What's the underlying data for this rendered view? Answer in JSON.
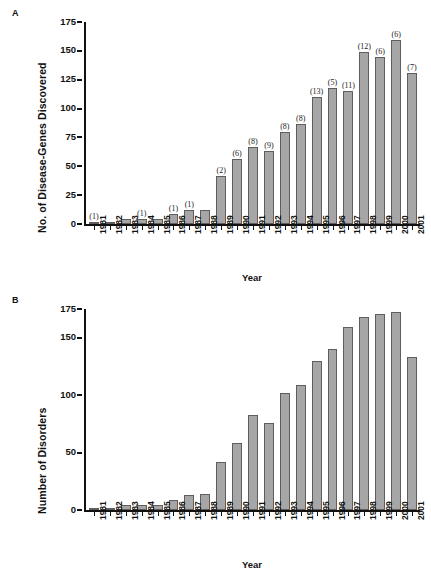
{
  "figure": {
    "panel_a_label": "A",
    "panel_b_label": "B"
  },
  "chart_data": [
    {
      "type": "bar",
      "panel": "A",
      "title": "",
      "xlabel": "Year",
      "ylabel": "No. of Disease-Genes Discovered",
      "ylim": [
        0,
        175
      ],
      "yticks": [
        0,
        25,
        50,
        75,
        100,
        125,
        150,
        175
      ],
      "grid": false,
      "legend": "none",
      "bar_color": "#a6a6a6",
      "bar_edge_color": "#5e5e5e",
      "categories": [
        "1981",
        "1982",
        "1983",
        "1984",
        "1985",
        "1986",
        "1987",
        "1988",
        "1989",
        "1990",
        "1991",
        "1992",
        "1993",
        "1994",
        "1995",
        "1996",
        "1997",
        "1998",
        "1999",
        "2000",
        "2001"
      ],
      "values": [
        2,
        1,
        4,
        4,
        4,
        9,
        12,
        12,
        42,
        56,
        67,
        63,
        80,
        87,
        110,
        118,
        115,
        149,
        145,
        159,
        131
      ],
      "annotations": [
        "(1)",
        "",
        "",
        "(1)",
        "",
        "(1)",
        "(1)",
        "",
        "(2)",
        "(6)",
        "(8)",
        "(9)",
        "(8)",
        "(8)",
        "(13)",
        "(5)",
        "(11)",
        "(12)",
        "(6)",
        "(6)",
        "(7)"
      ]
    },
    {
      "type": "bar",
      "panel": "B",
      "title": "",
      "xlabel": "Year",
      "ylabel": "Number of Disorders",
      "ylim": [
        0,
        175
      ],
      "yticks": [
        0,
        50,
        100,
        150,
        175
      ],
      "grid": false,
      "legend": "none",
      "bar_color": "#a6a6a6",
      "bar_edge_color": "#5e5e5e",
      "categories": [
        "1981",
        "1982",
        "1983",
        "1984",
        "1985",
        "1986",
        "1987",
        "1988",
        "1989",
        "1990",
        "1991",
        "1992",
        "1993",
        "1994",
        "1995",
        "1996",
        "1997",
        "1998",
        "1999",
        "2000",
        "2001"
      ],
      "values": [
        2,
        1,
        4,
        4,
        4,
        9,
        13,
        14,
        42,
        58,
        83,
        76,
        102,
        109,
        130,
        140,
        159,
        168,
        171,
        172,
        133
      ],
      "annotations": [
        "",
        "",
        "",
        "",
        "",
        "",
        "",
        "",
        "",
        "",
        "",
        "",
        "",
        "",
        "",
        "",
        "",
        "",
        "",
        "",
        ""
      ]
    }
  ]
}
